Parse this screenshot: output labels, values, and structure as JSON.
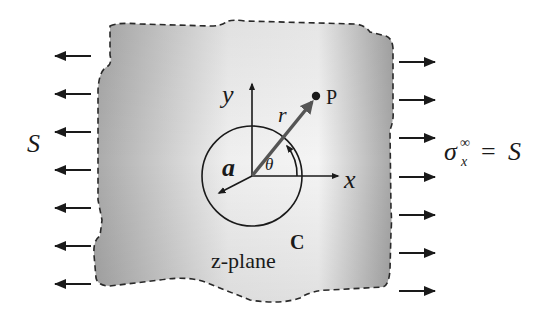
{
  "diagram": {
    "title_label": "z-plane",
    "left_load_label": "S",
    "right_load": {
      "sigma": "σ",
      "subscript": "x",
      "superscript": "∞",
      "equals": "=",
      "value": "S"
    },
    "axes": {
      "x_label": "x",
      "y_label": "y"
    },
    "hole": {
      "radius_label": "a",
      "contour_label": "C"
    },
    "point": {
      "label": "P",
      "radius_label": "r",
      "angle_label": "θ"
    },
    "left_arrow_count": 7,
    "right_arrow_count": 7,
    "colors": {
      "plate_dark": "#a8a8a8",
      "plate_light": "#f2f2f2",
      "stroke": "#2a2a2a",
      "radius_vector": "#555555"
    }
  }
}
